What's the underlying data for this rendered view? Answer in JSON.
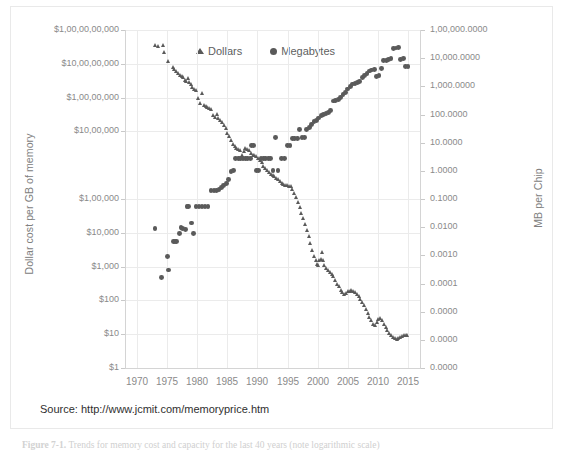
{
  "figure": {
    "source_text": "Source:  http://www.jcmit.com/memoryprice.htm",
    "caption_number": "Figure 7-1.",
    "caption_text": "Trends for memory cost and capacity for the last 40 years (note logarithmic scale)"
  },
  "colors": {
    "marker": "#5a5a5a",
    "gridline": "#ebebeb",
    "axis": "#d4d4d4",
    "tick_text": "#8a8a8a",
    "axis_title": "#808080"
  },
  "chart_data": {
    "type": "scatter",
    "title": "",
    "xlabel": "",
    "ylabel": "Dollar cost  per GB of memory",
    "y2label": "MB per Chip",
    "grid": true,
    "legend_position": "top-center",
    "xlim": [
      1968,
      2017
    ],
    "xticks": [
      1970,
      1975,
      1980,
      1985,
      1990,
      1995,
      2000,
      2005,
      2010,
      2015
    ],
    "xticklabels": [
      "1970",
      "1975",
      "1980",
      "1985",
      "1990",
      "1995",
      "2000",
      "2005",
      "2010",
      "2015"
    ],
    "yscale": "log",
    "ylim": [
      1,
      10000000000
    ],
    "yticks": [
      1,
      10,
      100,
      1000,
      10000,
      100000,
      10000000,
      100000000,
      1000000000,
      10000000000
    ],
    "yticklabels": [
      "$1",
      "$10",
      "$100",
      "$1,000",
      "$10,000",
      "$1,00,000",
      "$10,00,000",
      "$1,00,00,000",
      "$10,00,00,000",
      "$1,00,00,00,000"
    ],
    "y2scale": "log",
    "y2lim": [
      1e-07,
      100000
    ],
    "y2ticklabels": [
      "1,00,000.0000",
      "10,000.0000",
      "1,000.0000",
      "100.0000",
      "10.0000",
      "1.0000",
      "0.1000",
      "0.0100",
      "0.0010",
      "0.0001",
      "0.0000",
      "0.0000",
      "0.0000"
    ],
    "series": [
      {
        "name": "Dollars",
        "marker": "triangle",
        "axis": "left",
        "units": "USD per GB",
        "points": [
          [
            1973.0,
            3500000000
          ],
          [
            1973.6,
            3400000000
          ],
          [
            1974.4,
            3600000000
          ],
          [
            1974.6,
            2200000000
          ],
          [
            1975.2,
            1150000000
          ],
          [
            1976.0,
            780000000
          ],
          [
            1976.3,
            700000000
          ],
          [
            1976.6,
            600000000
          ],
          [
            1976.9,
            520000000
          ],
          [
            1977.2,
            460000000
          ],
          [
            1977.5,
            430000000
          ],
          [
            1977.8,
            400000000
          ],
          [
            1978.0,
            330000000
          ],
          [
            1978.3,
            300000000
          ],
          [
            1978.5,
            370000000
          ],
          [
            1978.8,
            290000000
          ],
          [
            1979.0,
            250000000
          ],
          [
            1979.3,
            200000000
          ],
          [
            1979.6,
            180000000
          ],
          [
            1979.9,
            160000000
          ],
          [
            1980.2,
            95000000
          ],
          [
            1980.6,
            70000000
          ],
          [
            1980.9,
            130000000
          ],
          [
            1981.2,
            60000000
          ],
          [
            1981.5,
            55000000
          ],
          [
            1981.8,
            52000000
          ],
          [
            1982.1,
            48000000
          ],
          [
            1982.4,
            45000000
          ],
          [
            1982.7,
            30000000
          ],
          [
            1983.0,
            27000000
          ],
          [
            1983.3,
            32000000
          ],
          [
            1983.6,
            25000000
          ],
          [
            1983.9,
            22000000
          ],
          [
            1984.2,
            19000000
          ],
          [
            1984.5,
            15000000
          ],
          [
            1984.8,
            12000000
          ],
          [
            1985.1,
            9000000
          ],
          [
            1985.4,
            7000000
          ],
          [
            1985.7,
            5500000
          ],
          [
            1986.0,
            4200000
          ],
          [
            1986.3,
            3600000
          ],
          [
            1986.6,
            3200000
          ],
          [
            1986.9,
            3000000
          ],
          [
            1987.2,
            2800000
          ],
          [
            1987.5,
            2000000
          ],
          [
            1987.8,
            2600000
          ],
          [
            1988.1,
            3100000
          ],
          [
            1988.4,
            2900000
          ],
          [
            1988.7,
            2700000
          ],
          [
            1989.0,
            2200000
          ],
          [
            1989.3,
            2000000
          ],
          [
            1989.6,
            1900000
          ],
          [
            1989.9,
            1800000
          ],
          [
            1990.2,
            1600000
          ],
          [
            1990.5,
            1400000
          ],
          [
            1990.8,
            1200000
          ],
          [
            1991.1,
            950000
          ],
          [
            1991.4,
            800000
          ],
          [
            1991.7,
            700000
          ],
          [
            1992.0,
            600000
          ],
          [
            1992.3,
            550000
          ],
          [
            1992.6,
            500000
          ],
          [
            1992.9,
            460000
          ],
          [
            1993.2,
            420000
          ],
          [
            1993.5,
            380000
          ],
          [
            1993.8,
            340000
          ],
          [
            1994.1,
            300000
          ],
          [
            1994.4,
            280000
          ],
          [
            1994.7,
            260000
          ],
          [
            1995.0,
            250000
          ],
          [
            1995.3,
            240000
          ],
          [
            1995.6,
            230000
          ],
          [
            1995.9,
            200000
          ],
          [
            1996.2,
            150000
          ],
          [
            1996.5,
            110000
          ],
          [
            1996.8,
            80000
          ],
          [
            1997.1,
            55000
          ],
          [
            1997.4,
            38000
          ],
          [
            1997.7,
            26000
          ],
          [
            1998.0,
            18000
          ],
          [
            1998.3,
            12000
          ],
          [
            1998.6,
            8000
          ],
          [
            1998.9,
            5000
          ],
          [
            1999.2,
            3000
          ],
          [
            1999.5,
            2000
          ],
          [
            1999.8,
            1500
          ],
          [
            2000.0,
            1200
          ],
          [
            2000.2,
            1100
          ],
          [
            2000.4,
            1500
          ],
          [
            2000.6,
            1700
          ],
          [
            2000.8,
            2600
          ],
          [
            2001.0,
            1500
          ],
          [
            2001.2,
            1100
          ],
          [
            2001.5,
            900
          ],
          [
            2001.8,
            800
          ],
          [
            2002.1,
            700
          ],
          [
            2002.4,
            600
          ],
          [
            2002.7,
            500
          ],
          [
            2003.0,
            400
          ],
          [
            2003.3,
            300
          ],
          [
            2003.6,
            260
          ],
          [
            2003.9,
            200
          ],
          [
            2004.2,
            170
          ],
          [
            2004.5,
            150
          ],
          [
            2004.8,
            160
          ],
          [
            2005.1,
            180
          ],
          [
            2005.4,
            190
          ],
          [
            2005.7,
            200
          ],
          [
            2006.0,
            185
          ],
          [
            2006.3,
            170
          ],
          [
            2006.6,
            150
          ],
          [
            2006.9,
            130
          ],
          [
            2007.2,
            110
          ],
          [
            2007.5,
            90
          ],
          [
            2007.8,
            70
          ],
          [
            2008.1,
            55
          ],
          [
            2008.4,
            42
          ],
          [
            2008.7,
            32
          ],
          [
            2009.0,
            25
          ],
          [
            2009.3,
            20
          ],
          [
            2009.6,
            18
          ],
          [
            2009.9,
            22
          ],
          [
            2010.2,
            28
          ],
          [
            2010.5,
            30
          ],
          [
            2010.8,
            26
          ],
          [
            2011.1,
            20
          ],
          [
            2011.4,
            16
          ],
          [
            2011.7,
            13
          ],
          [
            2012.0,
            11
          ],
          [
            2012.3,
            9
          ],
          [
            2012.6,
            8
          ],
          [
            2012.9,
            7.5
          ],
          [
            2013.2,
            7
          ],
          [
            2013.5,
            7.5
          ],
          [
            2013.8,
            8
          ],
          [
            2014.1,
            8.5
          ],
          [
            2014.4,
            9
          ],
          [
            2014.7,
            9.5
          ],
          [
            2015.0,
            9.5
          ]
        ]
      },
      {
        "name": "Megabytes",
        "marker": "circle",
        "axis": "right",
        "units": "MB per chip",
        "points": [
          [
            1973.0,
            0.009
          ],
          [
            1974.0,
            0.00016
          ],
          [
            1975.0,
            0.0009
          ],
          [
            1975.2,
            0.0003
          ],
          [
            1976.0,
            0.003
          ],
          [
            1976.3,
            0.003
          ],
          [
            1976.6,
            0.003
          ],
          [
            1977.0,
            0.006
          ],
          [
            1977.3,
            0.0095
          ],
          [
            1977.6,
            0.009
          ],
          [
            1978.0,
            0.008
          ],
          [
            1978.3,
            0.055
          ],
          [
            1978.6,
            0.055
          ],
          [
            1979.0,
            0.014
          ],
          [
            1979.4,
            0.006
          ],
          [
            1979.8,
            0.055
          ],
          [
            1980.3,
            0.055
          ],
          [
            1980.8,
            0.055
          ],
          [
            1981.3,
            0.055
          ],
          [
            1981.8,
            0.055
          ],
          [
            1982.3,
            0.2
          ],
          [
            1982.8,
            0.2
          ],
          [
            1983.2,
            0.2
          ],
          [
            1983.6,
            0.22
          ],
          [
            1984.0,
            0.25
          ],
          [
            1984.4,
            0.3
          ],
          [
            1984.8,
            0.35
          ],
          [
            1985.2,
            0.5
          ],
          [
            1985.6,
            0.95
          ],
          [
            1986.0,
            1.0
          ],
          [
            1986.4,
            2.8
          ],
          [
            1986.8,
            2.8
          ],
          [
            1987.2,
            2.8
          ],
          [
            1987.6,
            2.8
          ],
          [
            1988.0,
            2.8
          ],
          [
            1988.4,
            2.8
          ],
          [
            1988.8,
            2.8
          ],
          [
            1989.0,
            8.0
          ],
          [
            1989.4,
            8.0
          ],
          [
            1989.8,
            1.0
          ],
          [
            1990.2,
            1.0
          ],
          [
            1990.6,
            2.8
          ],
          [
            1991.0,
            2.8
          ],
          [
            1991.4,
            2.8
          ],
          [
            1991.8,
            2.8
          ],
          [
            1992.2,
            2.8
          ],
          [
            1992.6,
            1.0
          ],
          [
            1993.0,
            15.0
          ],
          [
            1993.4,
            1.0
          ],
          [
            1994.0,
            2.8
          ],
          [
            1994.5,
            2.8
          ],
          [
            1995.0,
            8.0
          ],
          [
            1995.4,
            8.0
          ],
          [
            1995.8,
            14.0
          ],
          [
            1996.2,
            14.0
          ],
          [
            1996.6,
            14.0
          ],
          [
            1997.0,
            30.0
          ],
          [
            1997.4,
            15.0
          ],
          [
            1997.8,
            15.0
          ],
          [
            1998.2,
            30.0
          ],
          [
            1998.6,
            35.0
          ],
          [
            1999.0,
            45.0
          ],
          [
            1999.4,
            55.0
          ],
          [
            1999.8,
            60.0
          ],
          [
            2000.2,
            75.0
          ],
          [
            2000.6,
            90.0
          ],
          [
            2001.0,
            100.0
          ],
          [
            2001.4,
            110.0
          ],
          [
            2001.8,
            120.0
          ],
          [
            2002.2,
            140.0
          ],
          [
            2002.6,
            300.0
          ],
          [
            2003.0,
            320.0
          ],
          [
            2003.4,
            340.0
          ],
          [
            2003.8,
            400.0
          ],
          [
            2004.2,
            500.0
          ],
          [
            2004.6,
            600.0
          ],
          [
            2005.0,
            800.0
          ],
          [
            2005.4,
            1000.0
          ],
          [
            2005.8,
            1200.0
          ],
          [
            2006.2,
            1300.0
          ],
          [
            2006.6,
            1400.0
          ],
          [
            2007.0,
            1500.0
          ],
          [
            2007.4,
            2000.0
          ],
          [
            2007.8,
            2400.0
          ],
          [
            2008.2,
            2800.0
          ],
          [
            2008.6,
            3500.0
          ],
          [
            2009.0,
            3800.0
          ],
          [
            2009.4,
            4000.0
          ],
          [
            2009.8,
            2200.0
          ],
          [
            2010.2,
            2400.0
          ],
          [
            2010.6,
            4200.0
          ],
          [
            2011.0,
            8000.0
          ],
          [
            2011.4,
            8500.0
          ],
          [
            2011.8,
            9000.0
          ],
          [
            2012.2,
            9500.0
          ],
          [
            2012.6,
            22000.0
          ],
          [
            2013.0,
            23000.0
          ],
          [
            2013.4,
            24000.0
          ],
          [
            2013.8,
            9000.0
          ],
          [
            2014.2,
            9500.0
          ],
          [
            2014.6,
            5000.0
          ],
          [
            2015.0,
            5200.0
          ]
        ]
      }
    ]
  },
  "legend": {
    "entries": [
      {
        "label": "Dollars",
        "marker": "triangle"
      },
      {
        "label": "Megabytes",
        "marker": "circle"
      }
    ]
  }
}
